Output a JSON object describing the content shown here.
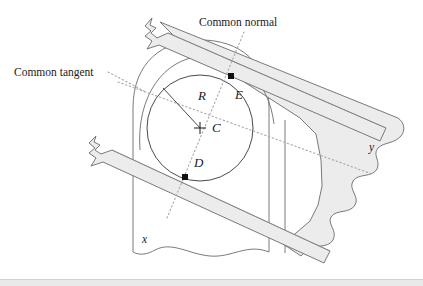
{
  "figure": {
    "labels": {
      "common_normal": "Common normal",
      "common_tangent": "Common tangent",
      "radius": "R",
      "center": "C",
      "contact_upper": "E",
      "contact_lower": "D",
      "body_left": "x",
      "body_right": "y"
    },
    "colors": {
      "outline": "#6b6b6b",
      "bar_fill": "#ececed",
      "band_fill": "#ececed",
      "dotted": "#a8a8a8",
      "marker": "#111111",
      "text": "#1a1a1a",
      "background": "#ffffff",
      "footer_rule": "#e9e9ea"
    },
    "geometry": {
      "circle_center": [
        200,
        128
      ],
      "circle_radius": 53,
      "contact_point_E": [
        231,
        76
      ],
      "contact_point_D": [
        185,
        177
      ],
      "radius_line_end": [
        163,
        88
      ],
      "normal_line": [
        [
          244,
          32
        ],
        [
          167,
          218
        ]
      ],
      "tangent_line": [
        [
          118,
          82
        ],
        [
          372,
          174
        ]
      ]
    }
  }
}
